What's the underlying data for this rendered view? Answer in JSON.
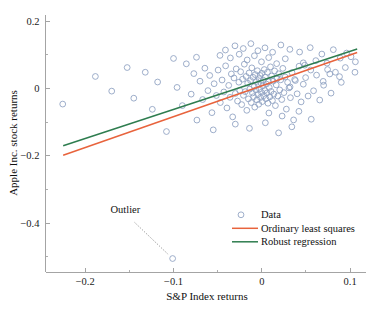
{
  "chart_data": {
    "type": "scatter",
    "title": "",
    "xlabel": "S&P Index returns",
    "ylabel": "Apple Inc. stock returns",
    "xlim": [
      -0.245,
      0.118
    ],
    "ylim": [
      -0.545,
      0.215
    ],
    "xticks": [
      -0.2,
      -0.1,
      0,
      0.1
    ],
    "xticklabels": [
      "−0.2",
      "−0.1",
      "0",
      "0.1"
    ],
    "yticks": [
      0.2,
      0,
      -0.2,
      -0.4
    ],
    "yticklabels": [
      "0.2",
      "0",
      "−0.2",
      "−0.4"
    ],
    "xminorticks": [
      -0.15,
      -0.05,
      0.05
    ],
    "yminorticks": [
      0.1,
      -0.1,
      -0.3,
      -0.5
    ],
    "grid": false,
    "legend_position": "lower right",
    "marker": {
      "shape": "circle-open",
      "color": "#8c9fc0",
      "size": 4.2
    },
    "series": [
      {
        "name": "Data",
        "type": "scatter",
        "color": "#8c9fc0",
        "points": [
          [
            -0.2255,
            -0.0465
          ],
          [
            -0.1885,
            0.0355
          ],
          [
            -0.17,
            -0.008
          ],
          [
            -0.1525,
            0.062
          ],
          [
            -0.145,
            -0.029
          ],
          [
            -0.132,
            0.048
          ],
          [
            -0.124,
            -0.062
          ],
          [
            -0.118,
            0.019
          ],
          [
            -0.108,
            -0.128
          ],
          [
            -0.101,
            -0.505
          ],
          [
            -0.096,
            0.003
          ],
          [
            -0.09,
            -0.051
          ],
          [
            -0.0855,
            0.073
          ],
          [
            -0.08,
            -0.017
          ],
          [
            -0.077,
            0.044
          ],
          [
            -0.0735,
            -0.094
          ],
          [
            -0.07,
            0.0215
          ],
          [
            -0.067,
            -0.033
          ],
          [
            -0.0645,
            0.06
          ],
          [
            -0.061,
            -0.0065
          ],
          [
            -0.059,
            0.0385
          ],
          [
            -0.0565,
            -0.072
          ],
          [
            -0.054,
            0.014
          ],
          [
            -0.0515,
            -0.021
          ],
          [
            -0.0495,
            0.0545
          ],
          [
            -0.047,
            -0.042
          ],
          [
            -0.045,
            0.025
          ],
          [
            -0.043,
            -0.0105
          ],
          [
            -0.041,
            0.067
          ],
          [
            -0.0395,
            -0.058
          ],
          [
            -0.0375,
            0.009
          ],
          [
            -0.036,
            -0.0265
          ],
          [
            -0.0345,
            0.043
          ],
          [
            -0.033,
            -0.0845
          ],
          [
            -0.0315,
            0.031
          ],
          [
            -0.03,
            -0.015
          ],
          [
            -0.029,
            0.058
          ],
          [
            -0.0275,
            -0.0375
          ],
          [
            -0.026,
            0.0185
          ],
          [
            -0.025,
            -0.006
          ],
          [
            -0.024,
            0.0495
          ],
          [
            -0.0228,
            -0.048
          ],
          [
            -0.0218,
            0.0275
          ],
          [
            -0.0208,
            -0.0205
          ],
          [
            -0.0198,
            0.072
          ],
          [
            -0.0188,
            -0.0095
          ],
          [
            -0.0178,
            0.0355
          ],
          [
            -0.017,
            -0.065
          ],
          [
            -0.016,
            0.0155
          ],
          [
            -0.0152,
            -0.031
          ],
          [
            -0.0144,
            0.046
          ],
          [
            -0.0136,
            -0.002
          ],
          [
            -0.0128,
            0.0235
          ],
          [
            -0.012,
            -0.042
          ],
          [
            -0.0113,
            0.061
          ],
          [
            -0.0106,
            -0.0135
          ],
          [
            -0.0099,
            0.033
          ],
          [
            -0.0092,
            -0.0245
          ],
          [
            -0.0086,
            0.0055
          ],
          [
            -0.008,
            -0.0555
          ],
          [
            -0.0074,
            0.041
          ],
          [
            -0.0068,
            -0.0045
          ],
          [
            -0.0062,
            0.0205
          ],
          [
            -0.0056,
            -0.034
          ],
          [
            -0.005,
            0.0525
          ],
          [
            -0.0045,
            -0.018
          ],
          [
            -0.004,
            0.0115
          ],
          [
            -0.0035,
            -0.047
          ],
          [
            -0.003,
            0.029
          ],
          [
            -0.0025,
            -0.0015
          ],
          [
            -0.002,
            0.0385
          ],
          [
            -0.0015,
            -0.027
          ],
          [
            -0.001,
            0.016
          ],
          [
            -0.0005,
            -0.0115
          ],
          [
            0.0,
            0.045
          ],
          [
            0.0005,
            -0.039
          ],
          [
            0.001,
            0.0075
          ],
          [
            0.0016,
            0.0245
          ],
          [
            0.0022,
            -0.0215
          ],
          [
            0.0028,
            0.056
          ],
          [
            0.0034,
            -0.006
          ],
          [
            0.004,
            0.0335
          ],
          [
            0.0046,
            -0.0305
          ],
          [
            0.0052,
            0.013
          ],
          [
            0.0058,
            -0.0135
          ],
          [
            0.0064,
            0.048
          ],
          [
            0.007,
            -0.044
          ],
          [
            0.0077,
            0.0195
          ],
          [
            0.0084,
            0.003
          ],
          [
            0.0091,
            -0.025
          ],
          [
            0.0098,
            0.064
          ],
          [
            0.0105,
            -0.009
          ],
          [
            0.0112,
            0.037
          ],
          [
            0.012,
            -0.036
          ],
          [
            0.0128,
            0.0215
          ],
          [
            0.0136,
            -0.017
          ],
          [
            0.0145,
            0.052
          ],
          [
            0.0154,
            -0.051
          ],
          [
            0.0163,
            0.0105
          ],
          [
            0.0172,
            0.029
          ],
          [
            0.0182,
            -0.0225
          ],
          [
            0.0192,
            0.0435
          ],
          [
            0.0203,
            -0.0045
          ],
          [
            0.0214,
            0.0255
          ],
          [
            0.0226,
            -0.033
          ],
          [
            0.0238,
            0.0595
          ],
          [
            0.025,
            -0.0125
          ],
          [
            0.0264,
            0.034
          ],
          [
            0.0278,
            -0.0615
          ],
          [
            0.0292,
            0.018
          ],
          [
            0.0308,
            0.0015
          ],
          [
            0.0324,
            -0.0275
          ],
          [
            0.0342,
            0.047
          ],
          [
            0.036,
            -0.0935
          ],
          [
            0.038,
            0.0235
          ],
          [
            0.04,
            -0.016
          ],
          [
            0.0422,
            0.066
          ],
          [
            0.0445,
            -0.04
          ],
          [
            0.047,
            0.0125
          ],
          [
            0.0496,
            0.032
          ],
          [
            0.0524,
            -0.0225
          ],
          [
            0.0554,
            0.0545
          ],
          [
            0.0586,
            -0.007
          ],
          [
            0.062,
            0.0395
          ],
          [
            0.0656,
            -0.0345
          ],
          [
            0.0695,
            0.021
          ],
          [
            0.0738,
            0.075
          ],
          [
            0.0784,
            -0.014
          ],
          [
            0.0834,
            0.048
          ],
          [
            0.0888,
            0.09
          ],
          [
            0.0946,
            0.062
          ],
          [
            0.101,
            0.094
          ],
          [
            0.106,
            0.079
          ],
          [
            0.096,
            0.105
          ],
          [
            0.088,
            0.035
          ],
          [
            0.081,
            0.115
          ],
          [
            0.0745,
            0.056
          ],
          [
            0.068,
            0.102
          ],
          [
            0.0612,
            0.0825
          ],
          [
            0.0548,
            0.121
          ],
          [
            0.0486,
            0.069
          ],
          [
            0.0428,
            0.108
          ],
          [
            0.0372,
            0.0265
          ],
          [
            0.0318,
            0.116
          ],
          [
            0.0266,
            0.088
          ],
          [
            0.0216,
            0.129
          ],
          [
            0.0168,
            0.0735
          ],
          [
            0.0122,
            0.1075
          ],
          [
            0.0078,
            0.0915
          ],
          [
            0.0036,
            0.1205
          ],
          [
            -0.0004,
            0.079
          ],
          [
            -0.0044,
            0.112
          ],
          [
            -0.0084,
            0.097
          ],
          [
            -0.0124,
            0.133
          ],
          [
            -0.0166,
            0.0845
          ],
          [
            -0.021,
            0.1185
          ],
          [
            -0.0256,
            0.1015
          ],
          [
            -0.0304,
            0.1265
          ],
          [
            -0.0356,
            0.0905
          ],
          [
            -0.0412,
            0.114
          ],
          [
            -0.0474,
            0.098
          ],
          [
            -0.03,
            -0.106
          ],
          [
            -0.014,
            -0.1185
          ],
          [
            0.004,
            -0.102
          ],
          [
            0.019,
            -0.132
          ],
          [
            0.034,
            -0.114
          ],
          [
            0.008,
            -0.073
          ],
          [
            0.023,
            -0.082
          ],
          [
            0.042,
            -0.068
          ],
          [
            0.056,
            -0.0915
          ],
          [
            -0.055,
            -0.123
          ],
          [
            0.07,
            0.0095
          ],
          [
            0.077,
            0.043
          ],
          [
            0.032,
            0.0045
          ],
          [
            0.047,
            0.076
          ],
          [
            -0.074,
            0.0925
          ],
          [
            -0.1,
            0.089
          ],
          [
            0.09,
            0.018
          ],
          [
            0.1055,
            0.048
          ]
        ]
      },
      {
        "name": "Ordinary least squares",
        "type": "line",
        "color": "#e8633c",
        "x": [
          -0.225,
          0.108
        ],
        "y": [
          -0.1985,
          0.1065
        ],
        "endpoints": [
          [
            -0.225,
            -0.1985
          ],
          [
            0.108,
            0.1065
          ]
        ]
      },
      {
        "name": "Robust regression",
        "type": "line",
        "color": "#2e7d4f",
        "x": [
          -0.225,
          0.108
        ],
        "y": [
          -0.17,
          0.117
        ],
        "endpoints": [
          [
            -0.225,
            -0.17
          ],
          [
            0.108,
            0.117
          ]
        ]
      }
    ],
    "annotations": [
      {
        "text": "Outlier",
        "text_x": -0.1545,
        "text_y": -0.37,
        "arrow_from_x": -0.144,
        "arrow_from_y": -0.398,
        "arrow_to_x": -0.1055,
        "arrow_to_y": -0.494,
        "style": "dotted-arrow"
      }
    ],
    "legend_entries": [
      {
        "label": "Data",
        "marker": "circle-open",
        "color": "#8c9fc0"
      },
      {
        "label": "Ordinary least squares",
        "marker": "line",
        "color": "#e8633c"
      },
      {
        "label": "Robust regression",
        "marker": "line",
        "color": "#2e7d4f"
      }
    ]
  },
  "axes": {
    "x_title": "S&P Index returns",
    "y_title": "Apple Inc. stock returns",
    "xticklabels": [
      "−0.2",
      "−0.1",
      "0",
      "0.1"
    ],
    "yticklabels": [
      "0.2",
      "0",
      "−0.2",
      "−0.4"
    ]
  },
  "legend": {
    "data_label": "Data",
    "ols_label": "Ordinary least squares",
    "robust_label": "Robust regression"
  },
  "annotation": {
    "outlier_label": "Outlier"
  },
  "colors": {
    "marker": "#8c9fc0",
    "ols_line": "#e8633c",
    "robust_line": "#2e7d4f",
    "axis": "#9a9a9a",
    "text": "#141414",
    "background": "#ffffff"
  }
}
